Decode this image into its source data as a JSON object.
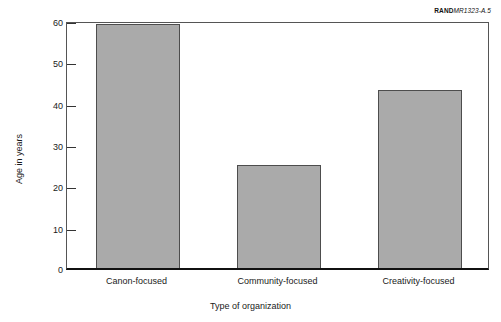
{
  "figure_id": {
    "brand": "RAND",
    "number": "MR1323-A.5"
  },
  "chart_data": {
    "type": "bar",
    "title": "",
    "subtitle": "",
    "xlabel": "Type of organization",
    "ylabel": "Age in years",
    "categories": [
      "Canon-focused",
      "Community-focused",
      "Creativity-focused"
    ],
    "values": [
      59,
      25,
      43
    ],
    "ylim": [
      0,
      60
    ],
    "yticks": [
      0,
      10,
      20,
      30,
      40,
      50,
      60
    ],
    "ytick_labels": [
      "0",
      "10",
      "20",
      "30",
      "40",
      "50",
      "60"
    ],
    "grid": false,
    "legend": null,
    "bar_color": "#aaaaaa",
    "bar_edge_color": "#4d4d4d",
    "axis_color": "#111111",
    "background": "#ffffff"
  }
}
